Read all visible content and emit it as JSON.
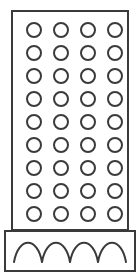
{
  "figure": {
    "name": "perforated-grater-icon",
    "style": "line-art outline",
    "canvas": {
      "width": 140,
      "height": 277
    },
    "colors": {
      "background": "#ffffff",
      "stroke": "#3a3a3a",
      "fill": "none"
    },
    "stroke_width": 2
  },
  "body_panel": {
    "name": "grater-body-panel",
    "shape": "rectangle",
    "x": 12,
    "y": 11,
    "width": 116,
    "height": 219,
    "corner_radius": 0
  },
  "hole_grid": {
    "name": "perforation-grid",
    "shape": "circle",
    "rows": 9,
    "columns": 4,
    "total_holes": 36,
    "diameter": 14,
    "radius": 7,
    "first_center_x": 34,
    "first_center_y": 30,
    "column_pitch": 27,
    "row_pitch": 23,
    "column_centers_x": [
      34,
      61,
      88,
      115
    ],
    "row_centers_y": [
      30,
      53,
      76,
      99,
      122,
      145,
      168,
      191,
      214
    ]
  },
  "base_plate": {
    "name": "grater-base-plate",
    "shape": "rectangle",
    "x": 5,
    "y": 231,
    "width": 130,
    "height": 40
  },
  "wave_trim": {
    "name": "scalloped-wave-trim",
    "bumps": 4,
    "baseline_y": 262,
    "crest_y": 241,
    "start_x": 14,
    "end_x": 126,
    "segment_width": 28
  },
  "labels": {
    "body_panel": "Grater body panel",
    "hole_grid": "Perforation hole grid",
    "base_plate": "Base plate",
    "wave_trim": "Scalloped wave trim"
  }
}
